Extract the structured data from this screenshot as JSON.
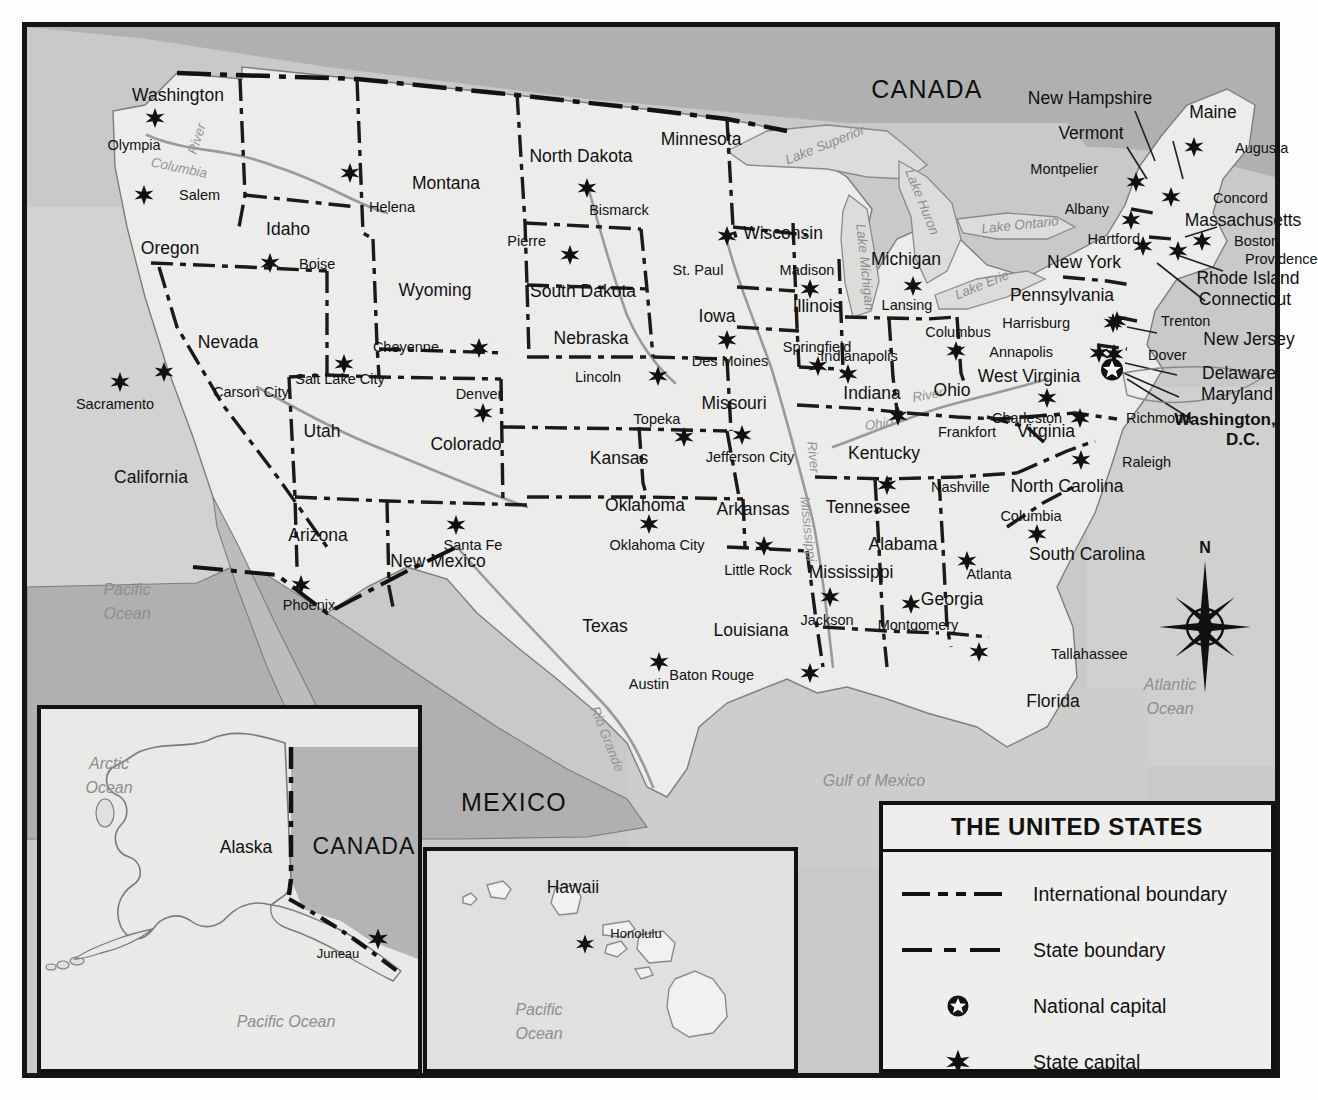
{
  "title": "THE UNITED STATES",
  "countries": [
    {
      "name": "CANADA",
      "x": 900,
      "y": 62,
      "cls": "country"
    },
    {
      "name": "MEXICO",
      "x": 487,
      "y": 775,
      "cls": "country mx"
    }
  ],
  "waters": [
    {
      "name": "Pacific",
      "x": 100,
      "y": 563,
      "cls": "water"
    },
    {
      "name": "Ocean",
      "x": 100,
      "y": 587,
      "cls": "water"
    },
    {
      "name": "Atlantic",
      "x": 1143,
      "y": 658,
      "cls": "water"
    },
    {
      "name": "Ocean",
      "x": 1143,
      "y": 682,
      "cls": "water"
    },
    {
      "name": "Gulf of Mexico",
      "x": 847,
      "y": 754,
      "cls": "water"
    },
    {
      "name": "Lake Superior",
      "x": 798,
      "y": 118,
      "cls": "water sm",
      "rot": -22
    },
    {
      "name": "Lake Huron",
      "x": 895,
      "y": 175,
      "cls": "water sm",
      "rot": 68
    },
    {
      "name": "Lake Michigan",
      "x": 838,
      "y": 240,
      "cls": "water sm",
      "rot": 84
    },
    {
      "name": "Lake Ontario",
      "x": 993,
      "y": 198,
      "cls": "water sm",
      "rot": -6
    },
    {
      "name": "Lake Erie",
      "x": 955,
      "y": 258,
      "cls": "water sm",
      "rot": -22
    }
  ],
  "rivers": [
    {
      "name": "River",
      "x": 170,
      "y": 112,
      "rot": -72
    },
    {
      "name": "Columbia",
      "x": 152,
      "y": 141,
      "rot": 12
    },
    {
      "name": "Mississippi",
      "x": 781,
      "y": 502,
      "rot": 84
    },
    {
      "name": "River",
      "x": 786,
      "y": 430,
      "rot": 84
    },
    {
      "name": "Ohio",
      "x": 852,
      "y": 397,
      "rot": -8
    },
    {
      "name": "River",
      "x": 901,
      "y": 368,
      "rot": -10
    },
    {
      "name": "Rio Grande",
      "x": 580,
      "y": 712,
      "rot": 68
    }
  ],
  "states": [
    {
      "name": "Washington",
      "x": 151,
      "y": 69,
      "cls": "state"
    },
    {
      "name": "Oregon",
      "x": 143,
      "y": 222,
      "cls": "state"
    },
    {
      "name": "Idaho",
      "x": 261,
      "y": 203,
      "cls": "state"
    },
    {
      "name": "Montana",
      "x": 419,
      "y": 157,
      "cls": "state"
    },
    {
      "name": "Wyoming",
      "x": 408,
      "y": 264,
      "cls": "state"
    },
    {
      "name": "Nevada",
      "x": 201,
      "y": 316,
      "cls": "state"
    },
    {
      "name": "Utah",
      "x": 295,
      "y": 405,
      "cls": "state"
    },
    {
      "name": "California",
      "x": 124,
      "y": 451,
      "cls": "state"
    },
    {
      "name": "Arizona",
      "x": 291,
      "y": 509,
      "cls": "state"
    },
    {
      "name": "New Mexico",
      "x": 411,
      "y": 535,
      "cls": "state"
    },
    {
      "name": "Colorado",
      "x": 439,
      "y": 418,
      "cls": "state"
    },
    {
      "name": "North Dakota",
      "x": 554,
      "y": 130,
      "cls": "state"
    },
    {
      "name": "South Dakota",
      "x": 556,
      "y": 265,
      "cls": "state"
    },
    {
      "name": "Nebraska",
      "x": 564,
      "y": 312,
      "cls": "state"
    },
    {
      "name": "Kansas",
      "x": 592,
      "y": 432,
      "cls": "state"
    },
    {
      "name": "Oklahoma",
      "x": 618,
      "y": 479,
      "cls": "state"
    },
    {
      "name": "Texas",
      "x": 578,
      "y": 600,
      "cls": "state"
    },
    {
      "name": "Minnesota",
      "x": 674,
      "y": 113,
      "cls": "state"
    },
    {
      "name": "Iowa",
      "x": 690,
      "y": 290,
      "cls": "state"
    },
    {
      "name": "Missouri",
      "x": 707,
      "y": 377,
      "cls": "state"
    },
    {
      "name": "Arkansas",
      "x": 726,
      "y": 483,
      "cls": "state"
    },
    {
      "name": "Louisiana",
      "x": 724,
      "y": 604,
      "cls": "state"
    },
    {
      "name": "Wisconsin",
      "x": 756,
      "y": 207,
      "cls": "state"
    },
    {
      "name": "Illinois",
      "x": 790,
      "y": 280,
      "cls": "state"
    },
    {
      "name": "Michigan",
      "x": 879,
      "y": 233,
      "cls": "state"
    },
    {
      "name": "Indiana",
      "x": 845,
      "y": 367,
      "cls": "state"
    },
    {
      "name": "Ohio",
      "x": 925,
      "y": 364,
      "cls": "state"
    },
    {
      "name": "Kentucky",
      "x": 857,
      "y": 427,
      "cls": "state"
    },
    {
      "name": "Tennessee",
      "x": 841,
      "y": 481,
      "cls": "state"
    },
    {
      "name": "Mississippi",
      "x": 824,
      "y": 546,
      "cls": "state"
    },
    {
      "name": "Alabama",
      "x": 876,
      "y": 518,
      "cls": "state"
    },
    {
      "name": "Georgia",
      "x": 925,
      "y": 573,
      "cls": "state"
    },
    {
      "name": "Florida",
      "x": 1026,
      "y": 675,
      "cls": "state"
    },
    {
      "name": "South Carolina",
      "x": 1060,
      "y": 528,
      "cls": "state"
    },
    {
      "name": "North Carolina",
      "x": 1040,
      "y": 460,
      "cls": "state"
    },
    {
      "name": "Virginia",
      "x": 1019,
      "y": 405,
      "cls": "state"
    },
    {
      "name": "West Virginia",
      "x": 1002,
      "y": 350,
      "cls": "state"
    },
    {
      "name": "Pennsylvania",
      "x": 1035,
      "y": 269,
      "cls": "state"
    },
    {
      "name": "New York",
      "x": 1057,
      "y": 236,
      "cls": "state"
    },
    {
      "name": "Maine",
      "x": 1186,
      "y": 86,
      "cls": "state"
    },
    {
      "name": "New Hampshire",
      "x": 1063,
      "y": 72,
      "cls": "state"
    },
    {
      "name": "Vermont",
      "x": 1064,
      "y": 107,
      "cls": "state"
    },
    {
      "name": "Massachusetts",
      "x": 1216,
      "y": 194,
      "cls": "state"
    },
    {
      "name": "Rhode Island",
      "x": 1221,
      "y": 252,
      "cls": "state"
    },
    {
      "name": "Connecticut",
      "x": 1218,
      "y": 273,
      "cls": "state"
    },
    {
      "name": "New Jersey",
      "x": 1222,
      "y": 313,
      "cls": "state"
    },
    {
      "name": "Delaware",
      "x": 1212,
      "y": 347,
      "cls": "state"
    },
    {
      "name": "Maryland",
      "x": 1210,
      "y": 368,
      "cls": "state"
    }
  ],
  "dc": {
    "line1": "Washington,",
    "line2": "D.C.",
    "x1": 1198,
    "y1": 392,
    "x2": 1216,
    "y2": 412
  },
  "capitals": [
    {
      "name": "Olympia",
      "lx": 107,
      "ly": 118,
      "sx": 128,
      "sy": 91,
      "anchor": "below"
    },
    {
      "name": "Salem",
      "lx": 152,
      "ly": 168,
      "sx": 117,
      "sy": 168,
      "anchor": "right"
    },
    {
      "name": "Boise",
      "sx": 243,
      "sy": 236,
      "lx": 272,
      "ly": 237,
      "anchor": "right"
    },
    {
      "name": "Helena",
      "sx": 323,
      "sy": 146,
      "lx": 365,
      "ly": 180,
      "anchor": "below"
    },
    {
      "name": "Cheyenne",
      "sx": 452,
      "sy": 321,
      "lx": 412,
      "ly": 320,
      "anchor": "left"
    },
    {
      "name": "Salt Lake City",
      "sx": 317,
      "sy": 337,
      "lx": 313,
      "ly": 352,
      "anchor": "below"
    },
    {
      "name": "Carson City",
      "sx": 137,
      "sy": 345,
      "lx": 186,
      "ly": 365,
      "anchor": "right"
    },
    {
      "name": "Sacramento",
      "sx": 93,
      "sy": 355,
      "lx": 88,
      "ly": 377,
      "anchor": "below"
    },
    {
      "name": "Phoenix",
      "sx": 274,
      "sy": 558,
      "lx": 282,
      "ly": 578,
      "anchor": "below"
    },
    {
      "name": "Santa Fe",
      "sx": 429,
      "sy": 498,
      "lx": 446,
      "ly": 518,
      "anchor": "below"
    },
    {
      "name": "Denver",
      "sx": 456,
      "sy": 386,
      "lx": 452,
      "ly": 367,
      "anchor": "above"
    },
    {
      "name": "Bismarck",
      "sx": 560,
      "sy": 161,
      "lx": 592,
      "ly": 183,
      "anchor": "below"
    },
    {
      "name": "Pierre",
      "sx": 543,
      "sy": 228,
      "lx": 519,
      "ly": 214,
      "anchor": "left"
    },
    {
      "name": "Lincoln",
      "sx": 631,
      "sy": 349,
      "lx": 594,
      "ly": 350,
      "anchor": "left"
    },
    {
      "name": "Topeka",
      "sx": 657,
      "sy": 410,
      "lx": 630,
      "ly": 392,
      "anchor": "above"
    },
    {
      "name": "Oklahoma City",
      "sx": 622,
      "sy": 497,
      "lx": 630,
      "ly": 518,
      "anchor": "below"
    },
    {
      "name": "Austin",
      "sx": 632,
      "sy": 635,
      "lx": 622,
      "ly": 657,
      "anchor": "below"
    },
    {
      "name": "St. Paul",
      "sx": 700,
      "sy": 209,
      "lx": 671,
      "ly": 243,
      "anchor": "below"
    },
    {
      "name": "Des Moines",
      "sx": 700,
      "sy": 313,
      "lx": 703,
      "ly": 334,
      "anchor": "below"
    },
    {
      "name": "Jefferson City",
      "sx": 715,
      "sy": 408,
      "lx": 723,
      "ly": 430,
      "anchor": "below"
    },
    {
      "name": "Little Rock",
      "sx": 737,
      "sy": 519,
      "lx": 731,
      "ly": 543,
      "anchor": "below"
    },
    {
      "name": "Baton Rouge",
      "sx": 783,
      "sy": 646,
      "lx": 727,
      "ly": 648,
      "anchor": "left"
    },
    {
      "name": "Madison",
      "sx": 783,
      "sy": 262,
      "lx": 780,
      "ly": 243,
      "anchor": "above"
    },
    {
      "name": "Springfield",
      "sx": 791,
      "sy": 339,
      "lx": 790,
      "ly": 320,
      "anchor": "above"
    },
    {
      "name": "Indianapolis",
      "sx": 821,
      "sy": 347,
      "lx": 832,
      "ly": 329,
      "anchor": "above"
    },
    {
      "name": "Lansing",
      "sx": 886,
      "sy": 259,
      "lx": 880,
      "ly": 278,
      "anchor": "below"
    },
    {
      "name": "Columbus",
      "sx": 929,
      "sy": 324,
      "lx": 931,
      "ly": 305,
      "anchor": "above"
    },
    {
      "name": "Frankfort",
      "sx": 871,
      "sy": 389,
      "lx": 911,
      "ly": 405,
      "anchor": "right"
    },
    {
      "name": "Nashville",
      "sx": 860,
      "sy": 458,
      "lx": 904,
      "ly": 460,
      "anchor": "right"
    },
    {
      "name": "Jackson",
      "sx": 803,
      "sy": 570,
      "lx": 800,
      "ly": 593,
      "anchor": "below"
    },
    {
      "name": "Montgomery",
      "sx": 884,
      "sy": 577,
      "lx": 891,
      "ly": 598,
      "anchor": "below"
    },
    {
      "name": "Atlanta",
      "sx": 940,
      "sy": 534,
      "lx": 962,
      "ly": 547,
      "anchor": "below"
    },
    {
      "name": "Tallahassee",
      "sx": 952,
      "sy": 625,
      "lx": 1024,
      "ly": 627,
      "anchor": "right"
    },
    {
      "name": "Columbia",
      "sx": 1010,
      "sy": 507,
      "lx": 1004,
      "ly": 489,
      "anchor": "above"
    },
    {
      "name": "Raleigh",
      "sx": 1054,
      "sy": 433,
      "lx": 1095,
      "ly": 435,
      "anchor": "right"
    },
    {
      "name": "Richmond",
      "sx": 1053,
      "sy": 391,
      "lx": 1099,
      "ly": 391,
      "anchor": "right"
    },
    {
      "name": "Charleston",
      "sx": 1020,
      "sy": 371,
      "lx": 1000,
      "ly": 391,
      "anchor": "below"
    },
    {
      "name": "Annapolis",
      "sx": 1072,
      "sy": 326,
      "lx": 1026,
      "ly": 325,
      "anchor": "left"
    },
    {
      "name": "Harrisburg",
      "sx": 1086,
      "sy": 296,
      "lx": 1043,
      "ly": 296,
      "anchor": "left"
    },
    {
      "name": "Dover",
      "sx": 1087,
      "sy": 327,
      "lx": 1121,
      "ly": 328,
      "anchor": "right"
    },
    {
      "name": "Trenton",
      "sx": 1090,
      "sy": 294,
      "lx": 1134,
      "ly": 294,
      "anchor": "right"
    },
    {
      "name": "Hartford",
      "sx": 1116,
      "sy": 219,
      "lx": 1113,
      "ly": 212,
      "anchor": "left"
    },
    {
      "name": "Boston",
      "sx": 1175,
      "sy": 214,
      "lx": 1207,
      "ly": 214,
      "anchor": "right"
    },
    {
      "name": "Providence",
      "sx": 1151,
      "sy": 224,
      "lx": 1218,
      "ly": 232,
      "anchor": "right"
    },
    {
      "name": "Albany",
      "sx": 1104,
      "sy": 193,
      "lx": 1082,
      "ly": 182,
      "anchor": "left"
    },
    {
      "name": "Montpelier",
      "sx": 1109,
      "sy": 155,
      "lx": 1071,
      "ly": 142,
      "anchor": "left"
    },
    {
      "name": "Concord",
      "sx": 1144,
      "sy": 170,
      "lx": 1186,
      "ly": 171,
      "anchor": "right"
    },
    {
      "name": "Augusta",
      "sx": 1167,
      "sy": 120,
      "lx": 1208,
      "ly": 121,
      "anchor": "right"
    }
  ],
  "national_capital": {
    "x": 1085,
    "y": 344,
    "name": "washington-dc-marker"
  },
  "insets": {
    "alaska": {
      "state": {
        "name": "Alaska",
        "x": 215,
        "y": 817
      },
      "country": {
        "name": "CANADA",
        "x": 333,
        "y": 815
      },
      "capital": {
        "name": "Juneau",
        "sx": 347,
        "sy": 908,
        "lx": 307,
        "ly": 922
      },
      "waters": [
        {
          "name": "Arctic",
          "x": 78,
          "y": 733
        },
        {
          "name": "Ocean",
          "x": 78,
          "y": 757
        },
        {
          "name": "Pacific Ocean",
          "x": 255,
          "y": 991
        }
      ]
    },
    "hawaii": {
      "state": {
        "name": "Hawaii",
        "x": 545,
        "y": 855
      },
      "capital": {
        "name": "Honolulu",
        "sx": 561,
        "sy": 911,
        "lx": 607,
        "ly": 900
      },
      "waters": [
        {
          "name": "Pacific",
          "x": 513,
          "y": 977
        },
        {
          "name": "Ocean",
          "x": 513,
          "y": 1001
        }
      ]
    }
  },
  "compass": {
    "label": "N",
    "x": 1178,
    "y": 521,
    "cx": 1178,
    "cy": 600
  },
  "legend": {
    "items": [
      {
        "label": "International boundary",
        "symbol": "international-boundary-line"
      },
      {
        "label": "State boundary",
        "symbol": "state-boundary-line"
      },
      {
        "label": "National capital",
        "symbol": "national-capital-symbol"
      },
      {
        "label": "State capital",
        "symbol": "state-capital-symbol"
      }
    ]
  },
  "colors": {
    "land": "#ececeb",
    "foreign": "#b3b3b3",
    "water": "#d8d8d7",
    "ink": "#121212",
    "riverGray": "#8f8f8f"
  }
}
